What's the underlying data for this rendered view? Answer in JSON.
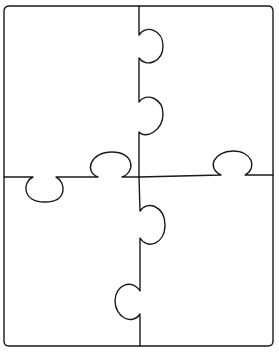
{
  "diagram": {
    "type": "jigsaw-puzzle-template",
    "pieces": 4,
    "layout": "2x2",
    "stroke_color": "#1a1a1a",
    "background_color": "#ffffff"
  }
}
